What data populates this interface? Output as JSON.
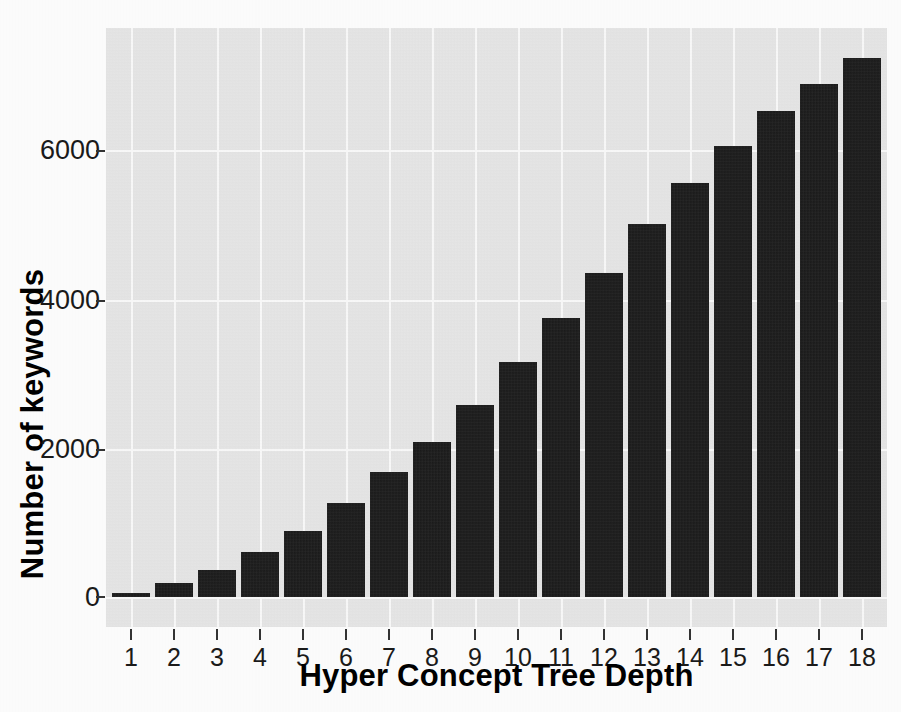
{
  "figure": {
    "kind": "scanned-bar-chart",
    "panel_background": "#e7e7e7",
    "gridline_color": "#fbfbfb",
    "bar_color": "#141414",
    "paper_background": "#fdfdfd"
  },
  "chart_data": {
    "type": "bar",
    "title": "",
    "xlabel": "Hyper Concept Tree Depth",
    "ylabel": "Number of keywords",
    "categories": [
      "1",
      "2",
      "3",
      "4",
      "5",
      "6",
      "7",
      "8",
      "9",
      "10",
      "11",
      "12",
      "13",
      "14",
      "15",
      "16",
      "17",
      "18"
    ],
    "values": [
      55,
      190,
      360,
      600,
      885,
      1260,
      1680,
      2080,
      2580,
      3155,
      3750,
      4355,
      5010,
      5560,
      6060,
      6520,
      6880,
      7230
    ],
    "ylim": [
      -250,
      7650
    ],
    "xlim": [
      0.4,
      18.6
    ],
    "yticks": [
      0,
      2000,
      4000,
      6000
    ],
    "ytick_labels": [
      "0",
      "2000",
      "4000",
      "6000"
    ],
    "xticks": [
      1,
      2,
      3,
      4,
      5,
      6,
      7,
      8,
      9,
      10,
      11,
      12,
      13,
      14,
      15,
      16,
      17,
      18
    ],
    "grid": true,
    "grid_major_color": "#ffffff",
    "legend": null,
    "legend_position": "none"
  },
  "axes": {
    "y_title": "Number of keywords",
    "x_title": "Hyper Concept Tree Depth",
    "y_tick_labels": [
      "6000",
      "4000",
      "2000",
      "0"
    ],
    "x_tick_labels": [
      "1",
      "2",
      "3",
      "4",
      "5",
      "6",
      "7",
      "8",
      "9",
      "10",
      "11",
      "12",
      "13",
      "14",
      "15",
      "16",
      "17",
      "18"
    ]
  },
  "bleed_through_text": {
    "note": "faint mirrored text from the reverse side of the scanned page",
    "lines": [
      "ibility of the randomization of the nodes in the tree",
      "tiers appear the most of all and has only the notion",
      "ing of varying the filtration process in ontology index",
      "of the hierarchy for the needs.",
      "hat we considered in the paper are organized in a",
      "perty of the attribute and constitutes a context of",
      "umber of shown keywords at each depth level of the",
      "tree, the first 1 to 4 levels from the keyword",
      "and the lower-most tails do not carry sufficiently",
      "n a depth of about 9 and grows further.",
      "indexed under the"
    ]
  }
}
